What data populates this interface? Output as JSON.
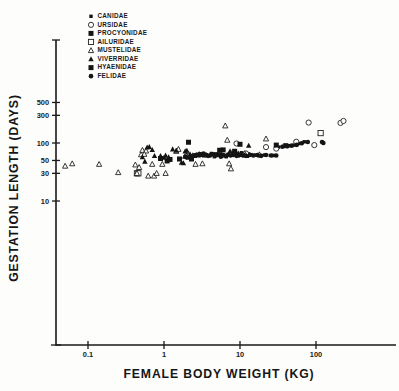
{
  "chart_data": {
    "type": "scatter",
    "title": "",
    "xlabel": "FEMALE  BODY  WEIGHT  (KG)",
    "ylabel": "GESTATION  LENGTH  (DAYS)",
    "xscale": "log",
    "yscale": "log",
    "xlim": [
      0.04,
      400
    ],
    "ylim": [
      4.5,
      700
    ],
    "grid": false,
    "legend_position": "top-left-inside",
    "xticks": [
      0.1,
      1,
      10,
      100
    ],
    "xtick_labels": [
      "0.1",
      "1",
      "10",
      "100"
    ],
    "yticks": [
      10,
      30,
      50,
      100,
      300,
      500
    ],
    "ytick_labels": [
      "10",
      "30",
      "50",
      "100",
      "300",
      "500"
    ],
    "series": [
      {
        "name": "CANIDAE",
        "marker": "filled-square-small",
        "points": [
          [
            3.2,
            62
          ],
          [
            3.6,
            63
          ],
          [
            4.0,
            60
          ],
          [
            4.6,
            58
          ],
          [
            5.2,
            62
          ],
          [
            6.2,
            60
          ],
          [
            7.0,
            63
          ],
          [
            8.0,
            62
          ],
          [
            9.5,
            60
          ],
          [
            11.0,
            62
          ],
          [
            12.5,
            59
          ],
          [
            14.0,
            63
          ],
          [
            16.0,
            62
          ],
          [
            18.0,
            60
          ],
          [
            21.0,
            62
          ],
          [
            25.0,
            61
          ],
          [
            28.0,
            61
          ],
          [
            32.0,
            85
          ],
          [
            38.0,
            88
          ],
          [
            45.0,
            90
          ],
          [
            52.0,
            92
          ],
          [
            60.0,
            98
          ],
          [
            70.0,
            105
          ],
          [
            2.6,
            59
          ],
          [
            2.9,
            60
          ],
          [
            3.0,
            65
          ],
          [
            4.2,
            66
          ],
          [
            5.6,
            64
          ],
          [
            6.6,
            58
          ],
          [
            8.6,
            64
          ],
          [
            10.5,
            68
          ],
          [
            13.0,
            65
          ]
        ]
      },
      {
        "name": "URSIDAE",
        "marker": "open-circle",
        "points": [
          [
            9.0,
            98
          ],
          [
            22.0,
            85
          ],
          [
            55.0,
            105
          ],
          [
            80.0,
            225
          ],
          [
            95.0,
            92
          ],
          [
            210.0,
            222
          ],
          [
            230.0,
            240
          ],
          [
            30.0,
            80
          ],
          [
            7.6,
            66
          ],
          [
            12.0,
            66
          ]
        ]
      },
      {
        "name": "PROCYONIDAE",
        "marker": "filled-square",
        "points": [
          [
            2.1,
            103
          ],
          [
            1.2,
            52
          ],
          [
            0.9,
            54
          ],
          [
            1.6,
            53
          ],
          [
            2.3,
            53
          ],
          [
            5.4,
            75
          ],
          [
            6.0,
            76
          ],
          [
            1.1,
            49
          ],
          [
            3.4,
            62
          ],
          [
            4.8,
            63
          ]
        ]
      },
      {
        "name": "AILURIDAE",
        "marker": "open-square",
        "points": [
          [
            115.0,
            148
          ],
          [
            0.44,
            30
          ],
          [
            0.46,
            30
          ]
        ]
      },
      {
        "name": "MUSTELIDAE",
        "marker": "open-triangle-small",
        "points": [
          [
            0.05,
            40
          ],
          [
            0.062,
            44
          ],
          [
            0.14,
            43
          ],
          [
            0.25,
            31
          ],
          [
            0.42,
            42
          ],
          [
            0.44,
            30
          ],
          [
            0.47,
            38
          ],
          [
            0.5,
            63
          ],
          [
            0.52,
            75
          ],
          [
            0.58,
            73
          ],
          [
            0.62,
            27
          ],
          [
            0.7,
            43
          ],
          [
            0.74,
            27
          ],
          [
            0.8,
            30
          ],
          [
            0.95,
            43
          ],
          [
            1.05,
            30
          ],
          [
            1.45,
            72
          ],
          [
            1.55,
            78
          ],
          [
            2.0,
            60
          ],
          [
            2.1,
            61
          ],
          [
            2.6,
            43
          ],
          [
            3.2,
            44
          ],
          [
            6.4,
            198
          ],
          [
            6.8,
            112
          ],
          [
            7.2,
            44
          ],
          [
            7.6,
            36
          ],
          [
            8.6,
            68
          ],
          [
            11.5,
            66
          ],
          [
            18.0,
            63
          ],
          [
            22.0,
            118
          ],
          [
            1.9,
            59
          ],
          [
            0.55,
            64
          ]
        ]
      },
      {
        "name": "VIVERRIDAE",
        "marker": "filled-triangle",
        "points": [
          [
            0.52,
            57
          ],
          [
            0.56,
            48
          ],
          [
            0.6,
            84
          ],
          [
            0.64,
            86
          ],
          [
            0.75,
            60
          ],
          [
            0.9,
            60
          ],
          [
            1.0,
            56
          ],
          [
            1.15,
            57
          ],
          [
            1.3,
            78
          ],
          [
            1.45,
            74
          ],
          [
            1.7,
            46
          ],
          [
            1.8,
            45
          ],
          [
            1.9,
            72
          ],
          [
            2.0,
            74
          ],
          [
            2.2,
            64
          ],
          [
            2.4,
            62
          ],
          [
            2.5,
            60
          ],
          [
            2.7,
            63
          ],
          [
            7.4,
            72
          ],
          [
            8.2,
            70
          ],
          [
            9.0,
            68
          ],
          [
            9.6,
            66
          ],
          [
            10.5,
            64
          ],
          [
            11.5,
            62
          ],
          [
            13.0,
            90
          ],
          [
            0.7,
            76
          ],
          [
            1.05,
            61
          ],
          [
            2.9,
            65
          ]
        ]
      },
      {
        "name": "HYAENIDAE",
        "marker": "filled-square",
        "points": [
          [
            30.0,
            92
          ],
          [
            40.0,
            90
          ],
          [
            10.0,
            95
          ],
          [
            8.5,
            72
          ]
        ]
      },
      {
        "name": "FELIDAE",
        "marker": "filled-circle",
        "points": [
          [
            2.6,
            62
          ],
          [
            2.9,
            64
          ],
          [
            3.1,
            63
          ],
          [
            3.3,
            66
          ],
          [
            3.5,
            62
          ],
          [
            3.8,
            60
          ],
          [
            4.1,
            62
          ],
          [
            4.4,
            64
          ],
          [
            4.8,
            61
          ],
          [
            5.2,
            63
          ],
          [
            5.6,
            58
          ],
          [
            6.0,
            62
          ],
          [
            6.5,
            60
          ],
          [
            7.0,
            63
          ],
          [
            7.5,
            61
          ],
          [
            8.2,
            62
          ],
          [
            9.0,
            60
          ],
          [
            10.0,
            62
          ],
          [
            11.0,
            61
          ],
          [
            12.0,
            60
          ],
          [
            13.5,
            62
          ],
          [
            15.0,
            61
          ],
          [
            17.0,
            62
          ],
          [
            19.0,
            60
          ],
          [
            22.0,
            62
          ],
          [
            26.0,
            61
          ],
          [
            30.0,
            61
          ],
          [
            36.0,
            86
          ],
          [
            42.0,
            88
          ],
          [
            48.0,
            90
          ],
          [
            56.0,
            93
          ],
          [
            65.0,
            99
          ],
          [
            78.0,
            104
          ],
          [
            120.0,
            104
          ],
          [
            125.0,
            100
          ],
          [
            2.4,
            60
          ],
          [
            2.2,
            55
          ],
          [
            2.0,
            56
          ],
          [
            1.9,
            58
          ]
        ]
      }
    ]
  },
  "legend": {
    "items": [
      {
        "label": "CANIDAE",
        "marker": "filled-square-small"
      },
      {
        "label": "URSIDAE",
        "marker": "open-circle"
      },
      {
        "label": "PROCYONIDAE",
        "marker": "filled-square"
      },
      {
        "label": "AILURIDAE",
        "marker": "open-square"
      },
      {
        "label": "MUSTELIDAE",
        "marker": "open-triangle-small"
      },
      {
        "label": "VIVERRIDAE",
        "marker": "filled-triangle"
      },
      {
        "label": "HYAENIDAE",
        "marker": "filled-square"
      },
      {
        "label": "FELIDAE",
        "marker": "filled-circle"
      }
    ]
  },
  "colors": {
    "ink": "#141414",
    "background": "#fdfdfc"
  }
}
